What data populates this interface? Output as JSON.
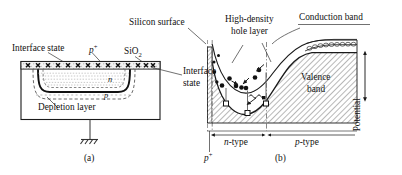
{
  "figure": {
    "caption_a": "(a)",
    "caption_b": "(b)"
  },
  "panel_a": {
    "label_interface_state_left": "Interface state",
    "label_pplus": "p",
    "label_pplus_sup": "+",
    "label_sio2": "SiO",
    "label_sio2_sub": "2",
    "label_interface_state_right_line1": "Interface",
    "label_interface_state_right_line2": "state",
    "label_depletion": "Depletion layer",
    "label_n_region": "n",
    "label_p_region": "p",
    "ground_symbol": "ground-hatch"
  },
  "panel_b": {
    "label_silicon_surface": "Silicon surface",
    "label_hole_layer_line1": "High-density",
    "label_hole_layer_line2": "hole layer",
    "label_conduction_band": "Conduction band",
    "label_valence_band_line1": "Valence",
    "label_valence_band_line2": "band",
    "label_potential": "Potential",
    "axis_pplus": "p",
    "axis_pplus_sup": "+",
    "axis_ntype": "n",
    "axis_ntype_suffix": "-type",
    "axis_ptype": "p",
    "axis_ptype_suffix": "-type",
    "carriers": {
      "electron_symbol": "filled-circle",
      "hole_symbol": "open-square",
      "photon_symbol": "wavy-line"
    }
  },
  "colors": {
    "line": "#1a1a1a",
    "hatch": "#8c8c8c",
    "fill_light": "#f2f2f2",
    "background": "#ffffff"
  }
}
